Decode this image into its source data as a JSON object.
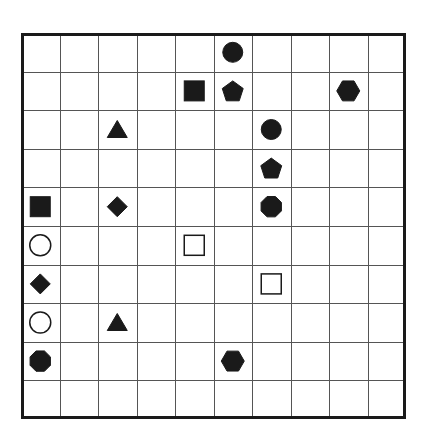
{
  "grid": {
    "rows": 10,
    "cols": 10,
    "line_color": "#555555",
    "border_color": "#1a1a1a",
    "shape_color": "#1a1a1a"
  },
  "pieces": [
    {
      "row": 0,
      "col": 5,
      "shape": "circle",
      "fill": "filled"
    },
    {
      "row": 1,
      "col": 4,
      "shape": "square",
      "fill": "filled"
    },
    {
      "row": 1,
      "col": 5,
      "shape": "pentagon",
      "fill": "filled"
    },
    {
      "row": 1,
      "col": 8,
      "shape": "hexagon",
      "fill": "filled"
    },
    {
      "row": 2,
      "col": 2,
      "shape": "triangle",
      "fill": "filled"
    },
    {
      "row": 2,
      "col": 6,
      "shape": "circle",
      "fill": "filled"
    },
    {
      "row": 3,
      "col": 6,
      "shape": "pentagon",
      "fill": "filled"
    },
    {
      "row": 4,
      "col": 0,
      "shape": "square",
      "fill": "filled"
    },
    {
      "row": 4,
      "col": 2,
      "shape": "diamond",
      "fill": "filled"
    },
    {
      "row": 4,
      "col": 6,
      "shape": "octagon",
      "fill": "filled"
    },
    {
      "row": 5,
      "col": 0,
      "shape": "circle",
      "fill": "open"
    },
    {
      "row": 5,
      "col": 4,
      "shape": "square",
      "fill": "open"
    },
    {
      "row": 6,
      "col": 0,
      "shape": "diamond",
      "fill": "filled"
    },
    {
      "row": 6,
      "col": 6,
      "shape": "square",
      "fill": "open"
    },
    {
      "row": 7,
      "col": 0,
      "shape": "circle",
      "fill": "open"
    },
    {
      "row": 7,
      "col": 2,
      "shape": "triangle",
      "fill": "filled"
    },
    {
      "row": 8,
      "col": 0,
      "shape": "octagon",
      "fill": "filled"
    },
    {
      "row": 8,
      "col": 5,
      "shape": "hexagon",
      "fill": "filled"
    }
  ]
}
